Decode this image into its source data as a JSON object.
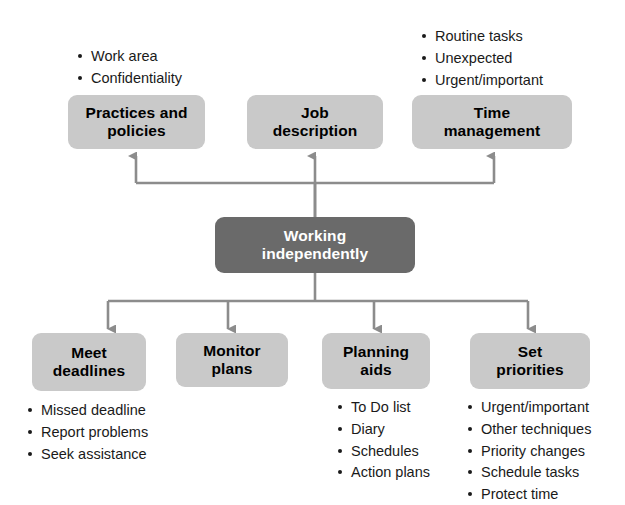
{
  "diagram": {
    "title_node": {
      "label": "Working\nindependently",
      "fill": "#6a6a6a",
      "text_color": "#ffffff"
    },
    "box_fill": "#c9c9c9",
    "connector_color": "#8c8c8c",
    "top_nodes": [
      {
        "id": "practices-and-policies",
        "label": "Practices and\npolicies",
        "bullets": [
          "Work area",
          "Confidentiality"
        ]
      },
      {
        "id": "job-description",
        "label": "Job\ndescription",
        "bullets": []
      },
      {
        "id": "time-management",
        "label": "Time\nmanagement",
        "bullets": [
          "Routine tasks",
          "Unexpected",
          "Urgent/important"
        ]
      }
    ],
    "bottom_nodes": [
      {
        "id": "meet-deadlines",
        "label": "Meet\ndeadlines",
        "bullets": [
          "Missed deadline",
          "Report problems",
          "Seek assistance"
        ]
      },
      {
        "id": "monitor-plans",
        "label": "Monitor\nplans",
        "bullets": []
      },
      {
        "id": "planning-aids",
        "label": "Planning\naids",
        "bullets": [
          "To Do list",
          "Diary",
          "Schedules",
          "Action plans"
        ]
      },
      {
        "id": "set-priorities",
        "label": "Set\npriorities",
        "bullets": [
          "Urgent/important",
          "Other techniques",
          "Priority changes",
          "Schedule tasks",
          "Protect time"
        ]
      }
    ]
  }
}
